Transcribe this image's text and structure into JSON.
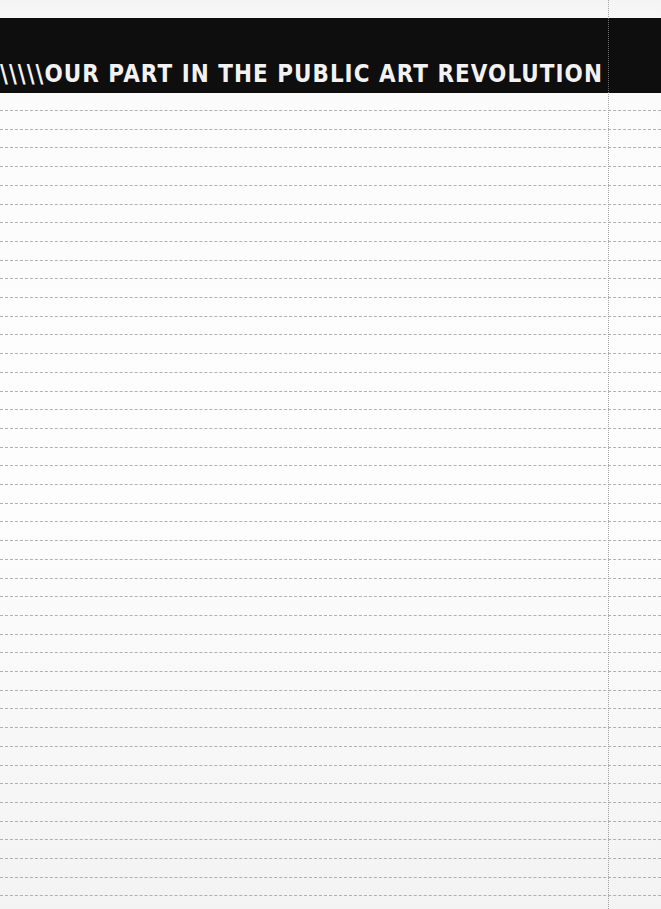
{
  "document": {
    "type": "ruled notepad page",
    "header_banner": {
      "title": "\\\\\\\\\\OUR PART IN THE PUBLIC ART REVOLUTION",
      "background_color": "#0e0e0e",
      "text_color": "#f2f2f2"
    },
    "ruled_lines": {
      "count": 43,
      "first_line_y": 110,
      "spacing_px": 18.7,
      "color": "#9a9a9a"
    },
    "margin_line": {
      "x": 608,
      "color": "#8c8c8c"
    },
    "paper_color": "#fbfbfb"
  }
}
